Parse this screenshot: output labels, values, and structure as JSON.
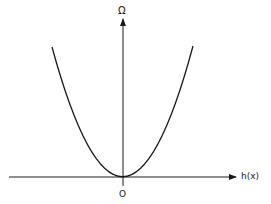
{
  "figure": {
    "type": "function-sketch",
    "axes": {
      "x_label": "h(x)",
      "y_label": "Ω",
      "origin_label": "O"
    },
    "curve": {
      "shape": "parabola",
      "vertex": "origin",
      "opens": "up"
    },
    "colors": {
      "stroke": "#1a1a1a",
      "background": "#ffffff"
    }
  }
}
